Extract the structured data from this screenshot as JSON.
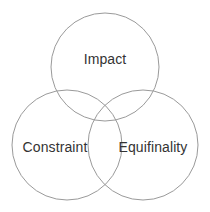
{
  "diagram": {
    "type": "venn-3-circle",
    "background_color": "#ffffff",
    "stroke_color": "#9a9a9a",
    "text_color": "#333333",
    "sets": [
      {
        "id": "impact",
        "label": "Impact",
        "position": "top",
        "center_x": 105,
        "center_y": 67,
        "radius": 54
      },
      {
        "id": "constraint",
        "label": "Constraint",
        "position": "bottom-left",
        "center_x": 67,
        "center_y": 145,
        "radius": 55
      },
      {
        "id": "equifinality",
        "label": "Equifinality",
        "position": "bottom-right",
        "center_x": 143,
        "center_y": 145,
        "radius": 55
      }
    ]
  }
}
